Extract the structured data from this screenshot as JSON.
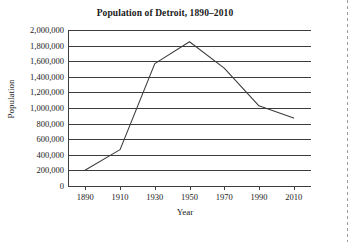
{
  "chart_data": {
    "type": "line",
    "title": "Population of Detroit, 1890–2010",
    "xlabel": "Year",
    "ylabel": "Population",
    "x": [
      1890,
      1910,
      1930,
      1950,
      1970,
      1990,
      2010
    ],
    "values": [
      206000,
      466000,
      1569000,
      1850000,
      1511000,
      1028000,
      871000
    ],
    "series": [
      {
        "name": "Population of Detroit",
        "values": [
          206000,
          466000,
          1569000,
          1850000,
          1511000,
          1028000,
          871000
        ]
      }
    ],
    "xtick_labels": [
      "1890",
      "1910",
      "1930",
      "1950",
      "1970",
      "1990",
      "2010"
    ],
    "ytick_values": [
      0,
      200000,
      400000,
      600000,
      800000,
      1000000,
      1200000,
      1400000,
      1600000,
      1800000,
      2000000
    ],
    "ytick_labels": [
      "0",
      "200,000",
      "400,000",
      "600,000",
      "800,000",
      "1,000,000",
      "1,200,000",
      "1,400,000",
      "1,600,000",
      "1,800,000",
      "2,000,000"
    ],
    "xlim": [
      1880,
      2020
    ],
    "ylim": [
      0,
      2000000
    ],
    "grid": "horizontal",
    "legend": "none",
    "line_color": "#3c3c3c",
    "background_color": "#ffffff"
  }
}
